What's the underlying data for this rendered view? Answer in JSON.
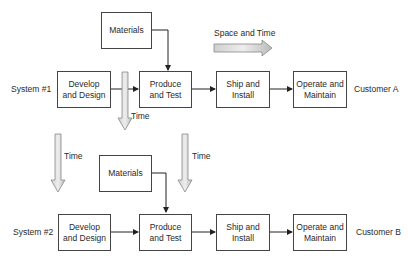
{
  "rows": [
    {
      "system_label": "System #1",
      "customer_label": "Customer A",
      "materials": "Materials",
      "steps": [
        "Develop\nand Design",
        "Produce\nand Test",
        "Ship and\nInstall",
        "Operate and\nMaintain"
      ]
    },
    {
      "system_label": "System #2",
      "customer_label": "Customer B",
      "materials": "Materials",
      "steps": [
        "Develop\nand Design",
        "Produce\nand Test",
        "Ship and\nInstall",
        "Operate and\nMaintain"
      ]
    }
  ],
  "arrows": {
    "space_and_time": "Space and Time",
    "time_1": "Time",
    "time_2": "Time",
    "time_3": "Time"
  }
}
